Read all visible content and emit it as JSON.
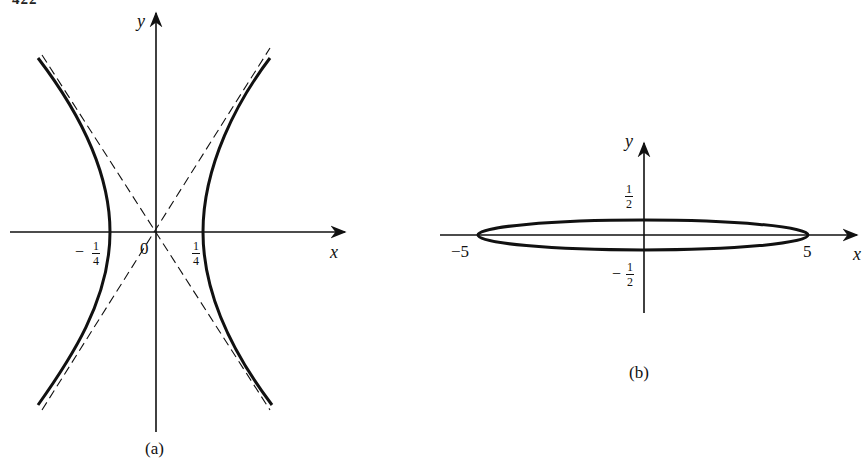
{
  "page": {
    "number_fragment": "422"
  },
  "figure_a": {
    "caption": "(a)",
    "axis_x_label": "x",
    "axis_y_label": "y",
    "origin_label": "0",
    "tick_left": {
      "sign": "−",
      "num": "1",
      "den": "4"
    },
    "tick_right": {
      "num": "1",
      "den": "4"
    },
    "curve": "hyperbola",
    "asymptotes": "dashed"
  },
  "figure_b": {
    "caption": "(b)",
    "axis_x_label": "x",
    "axis_y_label": "y",
    "tick_x_left": "−5",
    "tick_x_right": "5",
    "tick_y_top": {
      "num": "1",
      "den": "2"
    },
    "tick_y_bottom": {
      "sign": "−",
      "num": "1",
      "den": "2"
    },
    "curve": "ellipse"
  }
}
